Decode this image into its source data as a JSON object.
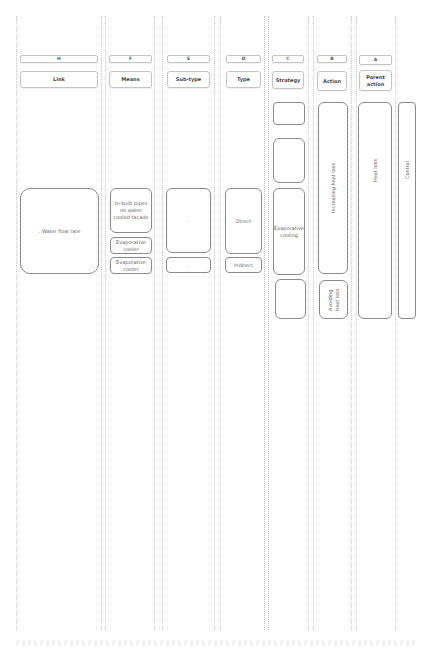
{
  "diagram": {
    "columns": [
      {
        "id": "H",
        "letter": "H",
        "label": "Link"
      },
      {
        "id": "F",
        "letter": "F",
        "label": "Means"
      },
      {
        "id": "E",
        "letter": "E",
        "label": "Sub-type"
      },
      {
        "id": "D",
        "letter": "D",
        "label": "Type"
      },
      {
        "id": "C",
        "letter": "C",
        "label": "Strategy"
      },
      {
        "id": "B",
        "letter": "B",
        "label": "Action"
      },
      {
        "id": "A",
        "letter": "A",
        "label": "Parent action"
      }
    ],
    "link": {
      "water_flow_rate": ". Water flow rate"
    },
    "means": {
      "in_built": "In-built pipes on water cooled facade",
      "evap_cooler_1": "Evaporative cooler",
      "evap_cooler_2": "Evaporative cooler"
    },
    "subtype": {
      "first": ".",
      "second": "."
    },
    "type": {
      "direct": "Direct",
      "indirect": "Indirect"
    },
    "strategy": {
      "empty_1": "",
      "empty_2": "",
      "evaporative_cooling": "Evaporative cooling",
      "empty_3": ""
    },
    "action": {
      "increasing_heat_loss": "Increasing heat loss",
      "avoiding_heat_loss": "Avoiding heat loss"
    },
    "parent_action": {
      "heat_loss": "Heat loss",
      "control": "Control"
    }
  }
}
